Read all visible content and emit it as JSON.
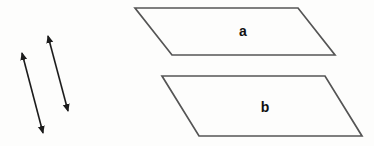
{
  "figure": {
    "colors": {
      "arrow": "#1c1c1c",
      "plane_edge": "#555555",
      "label": "#111111",
      "background": "#fdfdfc"
    },
    "planes": [
      {
        "label": "a",
        "points": "135,8 298,8 335,55 172,55",
        "label_x": 243,
        "label_y": 36
      },
      {
        "label": "b",
        "points": "162,76 325,76 362,136 199,136",
        "label_x": 265,
        "label_y": 112
      }
    ],
    "arrows": [
      {
        "path": "M22 53 L43 133"
      },
      {
        "path": "M48 36 L68 111"
      }
    ]
  }
}
